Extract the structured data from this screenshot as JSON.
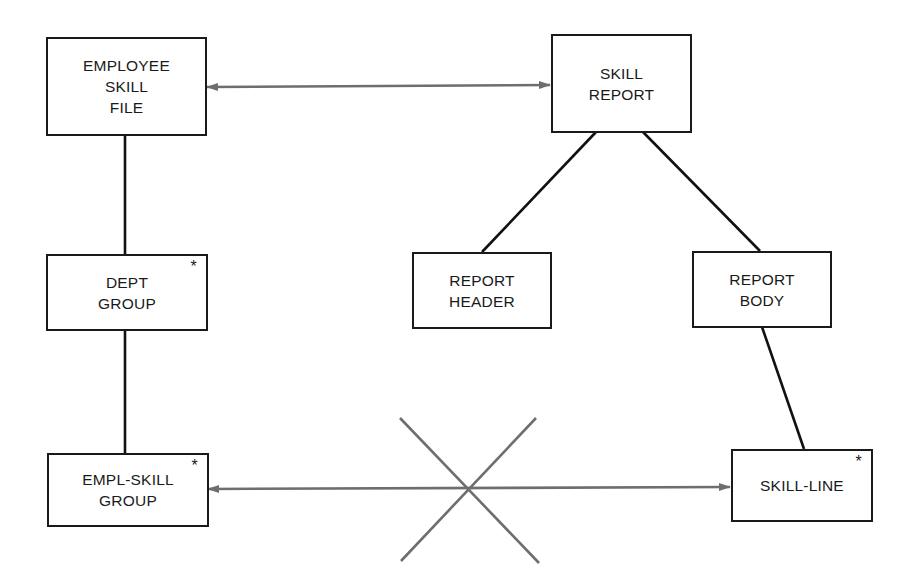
{
  "diagram": {
    "type": "data-structure / Jackson structure diagram",
    "colors": {
      "box_border": "#1a1a1a",
      "tree_line": "#111111",
      "correspondence_arrow": "#6e6e6e",
      "background": "#ffffff"
    },
    "nodes": {
      "employee_skill_file": {
        "lines": [
          "EMPLOYEE",
          "SKILL",
          "FILE"
        ],
        "iteration_marker": ""
      },
      "skill_report": {
        "lines": [
          "SKILL",
          "REPORT"
        ],
        "iteration_marker": ""
      },
      "dept_group": {
        "lines": [
          "DEPT",
          "GROUP"
        ],
        "iteration_marker": "*"
      },
      "report_header": {
        "lines": [
          "REPORT",
          "HEADER"
        ],
        "iteration_marker": ""
      },
      "report_body": {
        "lines": [
          "REPORT",
          "BODY"
        ],
        "iteration_marker": ""
      },
      "empl_skill_group": {
        "lines": [
          "EMPL-SKILL",
          "GROUP"
        ],
        "iteration_marker": "*"
      },
      "skill_line": {
        "lines": [
          "SKILL-LINE"
        ],
        "iteration_marker": "*"
      }
    },
    "edges": [
      {
        "from": "employee_skill_file",
        "to": "dept_group",
        "kind": "hierarchy"
      },
      {
        "from": "dept_group",
        "to": "empl_skill_group",
        "kind": "hierarchy"
      },
      {
        "from": "skill_report",
        "to": "report_header",
        "kind": "hierarchy"
      },
      {
        "from": "skill_report",
        "to": "report_body",
        "kind": "hierarchy"
      },
      {
        "from": "report_body",
        "to": "skill_line",
        "kind": "hierarchy"
      },
      {
        "from": "employee_skill_file",
        "to": "skill_report",
        "kind": "correspondence",
        "arrows": "both"
      },
      {
        "from": "empl_skill_group",
        "to": "skill_line",
        "kind": "correspondence",
        "arrows": "both",
        "crossed_out": true
      }
    ]
  }
}
